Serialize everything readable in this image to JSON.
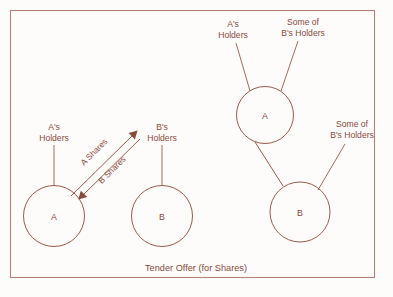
{
  "figure": {
    "caption": "Tender Offer (for Shares)",
    "colors": {
      "line": "#9a5b4c",
      "text": "#8b4a3c",
      "frame": "#b08478",
      "background": "#fdfcfb"
    }
  },
  "left_panel": {
    "nodes": [
      {
        "id": "company-a",
        "label": "A"
      },
      {
        "id": "company-b",
        "label": "B"
      }
    ],
    "holder_labels": [
      {
        "id": "a-holders",
        "line1": "A's",
        "line2": "Holders"
      },
      {
        "id": "b-holders",
        "line1": "B's",
        "line2": "Holders"
      }
    ],
    "arrows": [
      {
        "id": "a-shares-arrow",
        "label": "A Shares",
        "direction": "a-to-b-holders"
      },
      {
        "id": "b-shares-arrow",
        "label": "B Shares",
        "direction": "b-holders-to-a"
      }
    ]
  },
  "right_panel": {
    "nodes": [
      {
        "id": "company-a",
        "label": "A"
      },
      {
        "id": "company-b",
        "label": "B"
      }
    ],
    "holder_labels": [
      {
        "id": "a-holders",
        "line1": "A's",
        "line2": "Holders"
      },
      {
        "id": "some-b-holders-top",
        "line1": "Some of",
        "line2": "B's Holders"
      },
      {
        "id": "some-b-holders-right",
        "line1": "Some of",
        "line2": "B's Holders"
      }
    ]
  }
}
